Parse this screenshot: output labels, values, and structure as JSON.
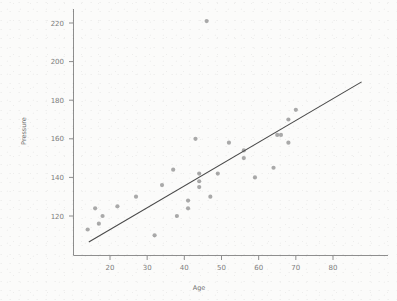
{
  "chart_data": {
    "type": "scatter",
    "title": "",
    "xlabel": "Age",
    "ylabel": "Pressure",
    "xlim": [
      10,
      88
    ],
    "ylim": [
      105,
      228
    ],
    "grid": false,
    "legend": "none",
    "xticks": [
      20,
      30,
      40,
      50,
      60,
      70,
      80
    ],
    "yticks": [
      120,
      140,
      160,
      180,
      200,
      220
    ],
    "xtick_labels": [
      "20",
      "30",
      "40",
      "50",
      "60",
      "70",
      "80"
    ],
    "ytick_labels": [
      "120",
      "140",
      "160",
      "180",
      "200",
      "220"
    ],
    "marker_color": "#a9a9a9",
    "line_color": "#4a4a4a",
    "axis_color": "#8e8e8e",
    "background_color": "#fbfbfa",
    "points": [
      {
        "x": 14,
        "y": 113
      },
      {
        "x": 16,
        "y": 124
      },
      {
        "x": 17,
        "y": 116
      },
      {
        "x": 18,
        "y": 120
      },
      {
        "x": 22,
        "y": 125
      },
      {
        "x": 27,
        "y": 130
      },
      {
        "x": 32,
        "y": 110
      },
      {
        "x": 34,
        "y": 136
      },
      {
        "x": 37,
        "y": 144
      },
      {
        "x": 38,
        "y": 120
      },
      {
        "x": 41,
        "y": 128
      },
      {
        "x": 41,
        "y": 124
      },
      {
        "x": 43,
        "y": 160
      },
      {
        "x": 44,
        "y": 142
      },
      {
        "x": 44,
        "y": 138
      },
      {
        "x": 44,
        "y": 135
      },
      {
        "x": 46,
        "y": 221
      },
      {
        "x": 47,
        "y": 130
      },
      {
        "x": 49,
        "y": 142
      },
      {
        "x": 52,
        "y": 158
      },
      {
        "x": 56,
        "y": 154
      },
      {
        "x": 56,
        "y": 150
      },
      {
        "x": 59,
        "y": 140
      },
      {
        "x": 64,
        "y": 145
      },
      {
        "x": 65,
        "y": 162
      },
      {
        "x": 66,
        "y": 162
      },
      {
        "x": 68,
        "y": 170
      },
      {
        "x": 68,
        "y": 158
      },
      {
        "x": 70,
        "y": 175
      }
    ],
    "fit_line": {
      "x_start": 14.3,
      "y_start": 106.5,
      "x_end": 87.7,
      "y_end": 189.5
    }
  }
}
